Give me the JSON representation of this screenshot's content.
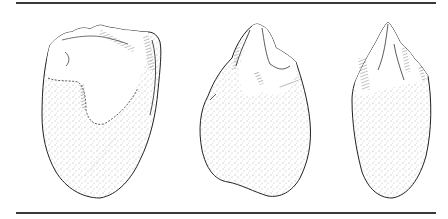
{
  "figure": {
    "artifacts": [
      {
        "id": "left",
        "view": "face",
        "shape": "broad oval, flaked top, stippled cortex lower body"
      },
      {
        "id": "middle",
        "view": "face",
        "shape": "rounded triangular, pointed flaked top, stippled body"
      },
      {
        "id": "right",
        "view": "profile",
        "shape": "narrow elongated, pointed flaked tip, stippled body"
      }
    ],
    "colors": {
      "ink": "#222222",
      "rule": "#3a3a3a",
      "background": "#ffffff"
    }
  }
}
